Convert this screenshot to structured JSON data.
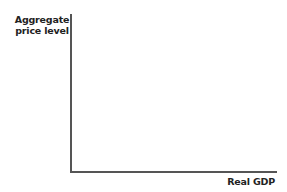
{
  "chart_data": {
    "type": "line",
    "title": "",
    "xlabel": "Real GDP",
    "ylabel": "Aggregate price level",
    "ylabel_lines": [
      "Aggregate",
      "price level"
    ],
    "series": [],
    "grid": false,
    "legend": null,
    "ticks": {
      "x": [],
      "y": []
    }
  }
}
